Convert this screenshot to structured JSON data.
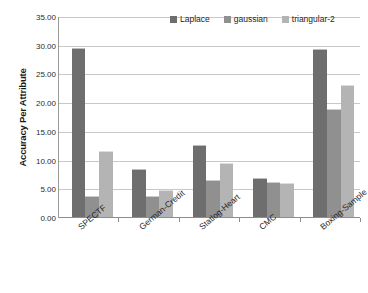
{
  "chart_data": {
    "type": "bar",
    "title": "",
    "xlabel": "",
    "ylabel": "Accuracy Per Attribute",
    "ylim": [
      0,
      35
    ],
    "ytick_step": 5,
    "ytick_labels": [
      "0.00",
      "5.00",
      "10.00",
      "15.00",
      "20.00",
      "25.00",
      "30.00",
      "35.00"
    ],
    "ytick_values": [
      0,
      5,
      10,
      15,
      20,
      25,
      30,
      35
    ],
    "grid": true,
    "legend_position": "top-right",
    "categories": [
      "SPECTF",
      "German-Credit",
      "Statlog-Heart",
      "CMC",
      "Boxing-Sample"
    ],
    "series": [
      {
        "name": "Laplace",
        "color": "#6e6e6e",
        "values": [
          29.6,
          8.6,
          12.7,
          7.0,
          29.4
        ]
      },
      {
        "name": "gaussian",
        "color": "#909090",
        "values": [
          3.8,
          3.9,
          6.6,
          6.2,
          18.9
        ]
      },
      {
        "name": "triangular-2",
        "color": "#b4b4b4",
        "values": [
          11.7,
          4.8,
          9.6,
          6.1,
          23.1
        ]
      }
    ]
  }
}
